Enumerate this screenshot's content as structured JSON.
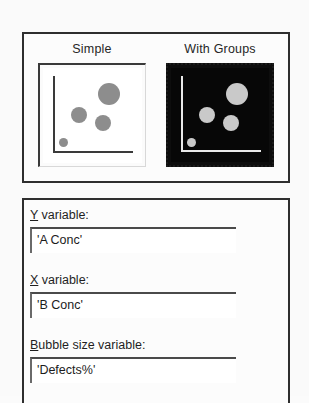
{
  "dialog": {
    "gallery": {
      "name": "plot-type-gallery",
      "items": [
        {
          "key": "simple",
          "label": "Simple",
          "selected": false,
          "thumbnail": {
            "style": "light",
            "axes": "L-shaped",
            "bubbles": [
              {
                "cx": 66,
                "cy": 26,
                "r": 11
              },
              {
                "cx": 36,
                "cy": 47,
                "r": 8
              },
              {
                "cx": 60,
                "cy": 55,
                "r": 8
              },
              {
                "cx": 20,
                "cy": 74,
                "r": 4
              }
            ]
          }
        },
        {
          "key": "with-groups",
          "label": "With Groups",
          "selected": true,
          "thumbnail": {
            "style": "dark",
            "axes": "L-shaped",
            "bubbles": [
              {
                "cx": 66,
                "cy": 26,
                "r": 11
              },
              {
                "cx": 36,
                "cy": 47,
                "r": 8
              },
              {
                "cx": 60,
                "cy": 55,
                "r": 8
              },
              {
                "cx": 20,
                "cy": 74,
                "r": 4
              }
            ]
          }
        }
      ]
    },
    "fields": [
      {
        "key": "y-variable",
        "accel": "Y",
        "label_rest": " variable:",
        "value": "'A Conc'",
        "placeholder": ""
      },
      {
        "key": "x-variable",
        "accel": "X",
        "label_rest": " variable:",
        "value": "'B Conc'",
        "placeholder": ""
      },
      {
        "key": "bubble-size-variable",
        "accel": "B",
        "label_rest": "ubble size variable:",
        "value": "'Defects%'",
        "placeholder": ""
      }
    ]
  },
  "colors": {
    "page_background": "#fafafa",
    "panel_background": "#fcfcfc",
    "panel_border": "#2e2e2e",
    "text": "#1f1f1f",
    "bubble_light": "#8d8d8d",
    "bubble_dark": "#c9c9c9",
    "thumb_dark_background": "#070707",
    "thumb_light_background": "#ffffff"
  }
}
